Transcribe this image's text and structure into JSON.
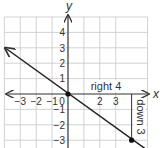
{
  "figure": {
    "type": "coordinate-plane-line",
    "axes": {
      "x_label": "x",
      "y_label": "y",
      "x_ticks": [
        {
          "value": -3,
          "label": "−3"
        },
        {
          "value": -2,
          "label": "−2"
        },
        {
          "value": -1,
          "label": "−1"
        },
        {
          "value": 0,
          "label": "0"
        },
        {
          "value": 2,
          "label": "2"
        },
        {
          "value": 3,
          "label": "3"
        }
      ],
      "y_ticks": [
        {
          "value": 4,
          "label": "4"
        },
        {
          "value": 3,
          "label": "3"
        },
        {
          "value": 2,
          "label": "2"
        },
        {
          "value": 1,
          "label": "1"
        },
        {
          "value": -1,
          "label": "−1"
        },
        {
          "value": -2,
          "label": "−2"
        },
        {
          "value": -3,
          "label": "−3"
        }
      ],
      "x_range": [
        -4,
        5
      ],
      "y_range": [
        -3.5,
        5
      ],
      "grid": true
    },
    "line": {
      "slope": "-3/4",
      "through": [
        [
          -4,
          3
        ],
        [
          0,
          0
        ],
        [
          4,
          -3
        ]
      ],
      "color": "#222222"
    },
    "points": [
      {
        "x": 0,
        "y": 0
      },
      {
        "x": 4,
        "y": -3
      }
    ],
    "annotations": {
      "run_label": "right 4",
      "rise_label": "down 3"
    },
    "colors": {
      "grid": "#c8c8c8",
      "axis": "#333333",
      "line": "#222222",
      "text": "#333333"
    }
  }
}
